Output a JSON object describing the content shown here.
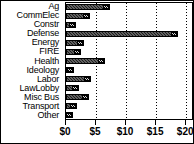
{
  "chart_data": {
    "type": "bar",
    "orientation": "horizontal",
    "title": "",
    "xlabel": "",
    "ylabel": "",
    "xlim": [
      0,
      21.3
    ],
    "grid": true,
    "legend": "none",
    "xtick_labels": [
      "$0",
      "$5",
      "$10",
      "$15",
      "$20"
    ],
    "xtick_values": [
      0,
      5,
      10,
      15,
      20
    ],
    "categories": [
      "Ag",
      "CommElec",
      "Constr",
      "Defense",
      "Energy",
      "FIRE",
      "Health",
      "Ideology",
      "Labor",
      "LawLobby",
      "Misc Bus",
      "Transport",
      "Other"
    ],
    "values": [
      7.3,
      4.0,
      1.7,
      18.6,
      3.0,
      2.5,
      6.5,
      1.3,
      4.2,
      2.2,
      3.8,
      1.9,
      1.2
    ]
  },
  "style": {
    "bar_color": "#1c1c1c",
    "background": "#ffffff",
    "axis_color": "#000000",
    "gridline_color": "#000000"
  }
}
